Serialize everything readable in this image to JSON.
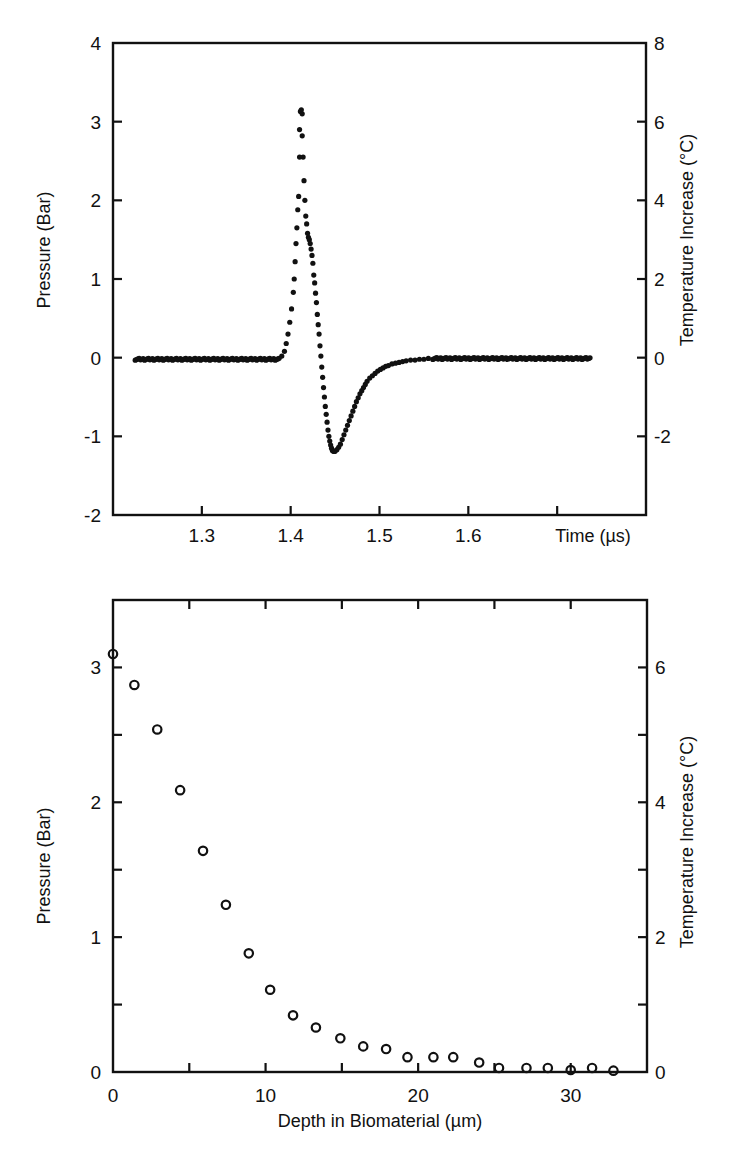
{
  "chart_data": [
    {
      "id": "top",
      "type": "scatter",
      "title": "",
      "xlabel": "Time (µs)",
      "ylabel": "Pressure (Bar)",
      "ylabel_right": "Temperature Increase (°C)",
      "xlim": [
        1.2,
        1.8
      ],
      "ylim": [
        -2,
        4
      ],
      "ylim_right": [
        -4,
        8
      ],
      "grid": false,
      "legend": null,
      "x_ticks": [
        1.3,
        1.4,
        1.5,
        1.6,
        1.7
      ],
      "x_tick_labels": [
        "1.3",
        "1.4",
        "1.5",
        "1.6",
        ""
      ],
      "y_ticks": [
        -1,
        0,
        1,
        2,
        3
      ],
      "y_tick_labels": [
        {
          "value": -2,
          "label": "-2"
        },
        {
          "value": -1,
          "label": "-1"
        },
        {
          "value": 0,
          "label": "0"
        },
        {
          "value": 1,
          "label": "1"
        },
        {
          "value": 2,
          "label": "2"
        },
        {
          "value": 3,
          "label": "3"
        },
        {
          "value": 4,
          "label": "4"
        }
      ],
      "y_right_tick_labels": [
        {
          "value": -1,
          "label": "-2"
        },
        {
          "value": 0,
          "label": "0"
        },
        {
          "value": 1,
          "label": "2"
        },
        {
          "value": 2,
          "label": "4"
        },
        {
          "value": 3,
          "label": "6"
        },
        {
          "value": 4,
          "label": "8"
        }
      ],
      "baseline_segments": [
        {
          "x_start": 1.225,
          "x_end": 1.388,
          "y": -0.02,
          "step": 0.0015
        },
        {
          "x_start": 1.56,
          "x_end": 1.738,
          "y": -0.01,
          "step": 0.0015
        }
      ],
      "series": [
        {
          "name": "Pressure transient",
          "marker": "filled-dot",
          "x": [
            1.39,
            1.393,
            1.395,
            1.397,
            1.399,
            1.401,
            1.403,
            1.404,
            1.405,
            1.406,
            1.407,
            1.408,
            1.409,
            1.41,
            1.41,
            1.411,
            1.412,
            1.413,
            1.413,
            1.414,
            1.415,
            1.416,
            1.417,
            1.418,
            1.419,
            1.42,
            1.421,
            1.422,
            1.423,
            1.424,
            1.425,
            1.426,
            1.427,
            1.428,
            1.429,
            1.43,
            1.431,
            1.432,
            1.433,
            1.434,
            1.435,
            1.436,
            1.437,
            1.438,
            1.439,
            1.44,
            1.441,
            1.442,
            1.443,
            1.444,
            1.445,
            1.446,
            1.447,
            1.448,
            1.449,
            1.45,
            1.452,
            1.454,
            1.456,
            1.458,
            1.46,
            1.462,
            1.464,
            1.466,
            1.468,
            1.47,
            1.472,
            1.474,
            1.476,
            1.478,
            1.48,
            1.482,
            1.484,
            1.486,
            1.489,
            1.492,
            1.495,
            1.498,
            1.501,
            1.504,
            1.507,
            1.51,
            1.514,
            1.518,
            1.522,
            1.526,
            1.53,
            1.535,
            1.54,
            1.545,
            1.55,
            1.555
          ],
          "y": [
            0.02,
            0.08,
            0.18,
            0.3,
            0.45,
            0.62,
            0.83,
            1.0,
            1.22,
            1.45,
            1.65,
            1.88,
            2.05,
            2.55,
            2.9,
            3.13,
            3.15,
            3.1,
            2.82,
            2.55,
            2.25,
            2.0,
            1.8,
            1.7,
            1.58,
            1.53,
            1.5,
            1.45,
            1.38,
            1.3,
            1.2,
            1.05,
            0.95,
            0.82,
            0.7,
            0.55,
            0.42,
            0.3,
            0.15,
            0.02,
            -0.12,
            -0.25,
            -0.38,
            -0.5,
            -0.62,
            -0.72,
            -0.82,
            -0.92,
            -1.0,
            -1.06,
            -1.11,
            -1.15,
            -1.18,
            -1.19,
            -1.19,
            -1.19,
            -1.17,
            -1.14,
            -1.1,
            -1.04,
            -0.98,
            -0.92,
            -0.86,
            -0.8,
            -0.74,
            -0.68,
            -0.62,
            -0.56,
            -0.51,
            -0.46,
            -0.42,
            -0.38,
            -0.34,
            -0.3,
            -0.26,
            -0.23,
            -0.2,
            -0.17,
            -0.15,
            -0.13,
            -0.11,
            -0.1,
            -0.08,
            -0.07,
            -0.06,
            -0.05,
            -0.04,
            -0.03,
            -0.03,
            -0.02,
            -0.02,
            -0.01
          ]
        }
      ]
    },
    {
      "id": "bottom",
      "type": "scatter",
      "title": "",
      "xlabel": "Depth in Biomaterial (µm)",
      "ylabel": "Pressure (Bar)",
      "ylabel_right": "Temperature Increase (°C)",
      "xlim": [
        0,
        35
      ],
      "ylim": [
        0,
        3.5
      ],
      "ylim_right": [
        0,
        7
      ],
      "grid": false,
      "legend": null,
      "x_ticks": [
        5,
        10,
        15,
        20,
        25,
        30
      ],
      "x_tick_labels": [
        {
          "value": 0,
          "label": "0"
        },
        {
          "value": 10,
          "label": "10"
        },
        {
          "value": 20,
          "label": "20"
        },
        {
          "value": 30,
          "label": "30"
        }
      ],
      "y_ticks": [
        0.5,
        1,
        1.5,
        2,
        2.5,
        3
      ],
      "y_tick_labels": [
        {
          "value": 0,
          "label": "0"
        },
        {
          "value": 1,
          "label": "1"
        },
        {
          "value": 2,
          "label": "2"
        },
        {
          "value": 3,
          "label": "3"
        }
      ],
      "y_right_tick_labels": [
        {
          "value": 0,
          "label": "0"
        },
        {
          "value": 1,
          "label": "2"
        },
        {
          "value": 2,
          "label": "4"
        },
        {
          "value": 3,
          "label": "6"
        }
      ],
      "series": [
        {
          "name": "Peak pressure vs depth",
          "marker": "open-circle",
          "x": [
            0.0,
            1.4,
            2.9,
            4.4,
            5.9,
            7.4,
            8.9,
            10.3,
            11.8,
            13.3,
            14.9,
            16.4,
            17.9,
            19.3,
            21.0,
            22.3,
            24.0,
            25.3,
            27.1,
            28.5,
            30.0,
            31.4,
            32.8
          ],
          "y": [
            3.1,
            2.87,
            2.54,
            2.09,
            1.64,
            1.24,
            0.88,
            0.61,
            0.42,
            0.33,
            0.25,
            0.19,
            0.17,
            0.11,
            0.11,
            0.11,
            0.07,
            0.03,
            0.03,
            0.03,
            0.015,
            0.03,
            0.01
          ]
        }
      ]
    }
  ],
  "layout": {
    "top": {
      "left": 113,
      "right": 646,
      "top": 43,
      "bottom": 515
    },
    "bottom": {
      "left": 113,
      "right": 647,
      "top": 600,
      "bottom": 1072
    }
  }
}
